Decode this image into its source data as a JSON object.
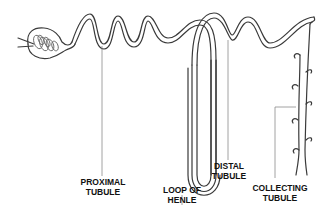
{
  "diagram": {
    "labels": [
      {
        "id": "proximal",
        "line1": "PROXIMAL",
        "line2": "TUBULE"
      },
      {
        "id": "loop",
        "line1": "LOOP OF",
        "line2": "HENLE"
      },
      {
        "id": "distal",
        "line1": "DISTAL",
        "line2": "TUBULE"
      },
      {
        "id": "collecting",
        "line1": "COLLECTING",
        "line2": "TUBULE"
      }
    ],
    "colors": {
      "line": "#3a3a3a",
      "leader": "#8a8a8a",
      "text": "#111111",
      "background": "#ffffff"
    }
  }
}
